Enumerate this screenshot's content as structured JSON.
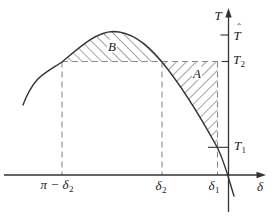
{
  "labels": {
    "y_axis": "T",
    "x_axis": "δ",
    "t_hat": {
      "base": "T",
      "hat": "ˆ"
    },
    "t2": {
      "base": "T",
      "sub": "2"
    },
    "t1": {
      "base": "T",
      "sub": "1"
    },
    "pi_minus_delta2": {
      "pre": "π − ",
      "base": "δ",
      "sub": "2"
    },
    "delta2": {
      "base": "δ",
      "sub": "2"
    },
    "delta1": {
      "base": "δ",
      "sub": "1"
    },
    "region_a": "A",
    "region_b": "B"
  },
  "colors": {
    "ink": "#333333",
    "dash": "#8a8a8a",
    "hatch": "#4a4a4a",
    "text": "#222222",
    "background": "#ffffff"
  }
}
